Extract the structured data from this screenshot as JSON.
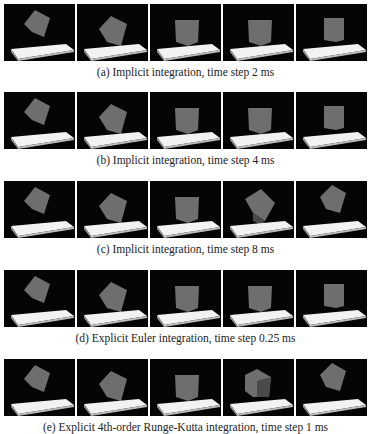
{
  "figure": {
    "rows": [
      {
        "id": "a",
        "caption": "(a) Implicit integration, time step 2 ms",
        "frames": [
          "tilted-high",
          "tilted-falling",
          "upright",
          "upright",
          "upright-narrow"
        ]
      },
      {
        "id": "b",
        "caption": "(b) Implicit integration, time step 4 ms",
        "frames": [
          "tilted-high",
          "tilted-falling",
          "upright",
          "upright",
          "upright-narrow"
        ]
      },
      {
        "id": "c",
        "caption": "(c) Implicit integration, time step 8 ms",
        "frames": [
          "tilted-high",
          "tilted-falling",
          "upright",
          "bounce-tilted",
          "bounce-high"
        ]
      },
      {
        "id": "d",
        "caption": "(d) Explicit Euler integration, time step 0.25 ms",
        "frames": [
          "tilted-high",
          "tilted-falling",
          "upright",
          "upright",
          "upright-narrow"
        ]
      },
      {
        "id": "e",
        "caption": "(e) Explicit 4th-order Runge-Kutta integration, time step 1 ms",
        "frames": [
          "tilted-high",
          "tilted-falling",
          "upright",
          "upright-rotated",
          "bounce-high"
        ]
      }
    ],
    "colors": {
      "background": "#050505",
      "plate_top": "#f2f2f2",
      "plate_side": "#9a9a9a",
      "cube": "#6e6e6e",
      "cube_dark": "#4a4a4a"
    }
  }
}
